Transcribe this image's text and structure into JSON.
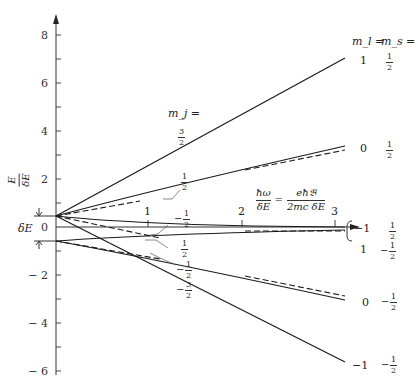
{
  "diagram": {
    "y_axis": {
      "label_num": "E",
      "label_den": "δE",
      "ticks": [
        "8",
        "6",
        "4",
        "2",
        "0",
        "− 2",
        "− 4",
        "− 6"
      ],
      "tick_values": [
        8,
        6,
        4,
        2,
        0,
        -2,
        -4,
        -6
      ]
    },
    "x_axis": {
      "ticks": [
        "1",
        "2",
        "3"
      ],
      "formula_lhs_num": "ħω",
      "formula_lhs_den": "δE",
      "formula_eq": "=",
      "formula_rhs_num": "eħ𝔅",
      "formula_rhs_den": "2mc δE"
    },
    "delta_e_label": "δE",
    "mj_header": "m_j =",
    "mj_labels": {
      "three_half": {
        "num": "3",
        "den": "2",
        "sign": ""
      },
      "half_upper": {
        "num": "1",
        "den": "2",
        "sign": ""
      },
      "neg_half_upper": {
        "num": "1",
        "den": "2",
        "sign": "−"
      },
      "half_lower": {
        "num": "1",
        "den": "2",
        "sign": ""
      },
      "neg_half_lower": {
        "num": "1",
        "den": "2",
        "sign": "−"
      },
      "neg_three_half": {
        "num": "3",
        "den": "2",
        "sign": "−"
      }
    },
    "right_header": {
      "ml": "m_l =",
      "ms": "m_s ="
    },
    "right_labels": [
      {
        "ml": "1",
        "ms_sign": "",
        "ms_num": "1",
        "ms_den": "2"
      },
      {
        "ml": "0",
        "ms_sign": "",
        "ms_num": "1",
        "ms_den": "2"
      },
      {
        "ml": "−1",
        "ms_sign": "",
        "ms_num": "1",
        "ms_den": "2"
      },
      {
        "ml": "1",
        "ms_sign": "−",
        "ms_num": "1",
        "ms_den": "2"
      },
      {
        "ml": "0",
        "ms_sign": "−",
        "ms_num": "1",
        "ms_den": "2"
      },
      {
        "ml": "−1",
        "ms_sign": "−",
        "ms_num": "1",
        "ms_den": "2"
      }
    ],
    "colors": {
      "line": "#1a1a1a",
      "axis": "#333333",
      "background": "#ffffff"
    }
  }
}
